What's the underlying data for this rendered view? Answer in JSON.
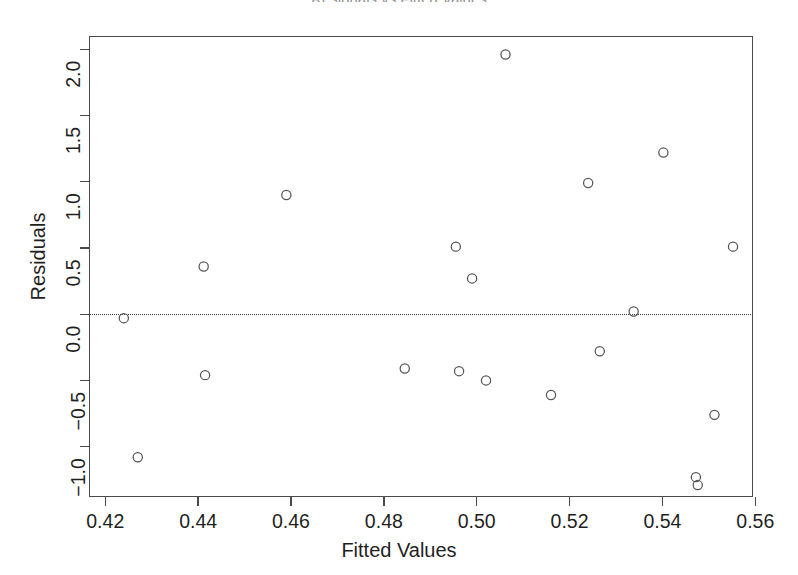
{
  "chart_data": {
    "type": "scatter",
    "title": "Residuals vs Fitted Values",
    "xlabel": "Fitted Values",
    "ylabel": "Residuals",
    "xlim": [
      0.4165,
      0.5595
    ],
    "ylim": [
      -1.38,
      2.1
    ],
    "xticks": [
      0.42,
      0.44,
      0.46,
      0.48,
      0.5,
      0.52,
      0.54,
      0.56
    ],
    "xticklabels": [
      "0.42",
      "0.44",
      "0.46",
      "0.48",
      "0.50",
      "0.52",
      "0.54",
      "0.56"
    ],
    "yticks": [
      -1.0,
      -0.5,
      0.0,
      0.5,
      1.0,
      1.5,
      2.0
    ],
    "yticklabels": [
      "-1.0",
      "-0.5",
      "0.0",
      "0.5",
      "1.0",
      "1.5",
      "2.0"
    ],
    "grid": false,
    "legend": null,
    "reference_line": {
      "orientation": "horizontal",
      "y": 0.0,
      "style": "dotted",
      "color": "#3c3c3c"
    },
    "marker": {
      "shape": "open-circle",
      "radius_px": 4.6,
      "stroke": "#555555",
      "fill": "none"
    },
    "n_points": 21,
    "x": [
      0.424,
      0.427,
      0.4412,
      0.4415,
      0.459,
      0.4845,
      0.4955,
      0.4962,
      0.499,
      0.502,
      0.5062,
      0.516,
      0.517,
      0.524,
      0.5265,
      0.5338,
      0.5402,
      0.5472,
      0.5476,
      0.5512,
      0.5552
    ],
    "y": [
      -0.03,
      -1.08,
      0.36,
      -0.46,
      0.9,
      -0.41,
      0.51,
      -0.43,
      0.27,
      -0.5,
      1.96,
      -0.61,
      -0.61,
      0.99,
      -0.28,
      0.02,
      1.22,
      -1.23,
      -1.29,
      -0.76,
      0.51
    ],
    "points": [
      {
        "x": 0.424,
        "y": -0.03
      },
      {
        "x": 0.427,
        "y": -1.08
      },
      {
        "x": 0.4412,
        "y": 0.36
      },
      {
        "x": 0.4415,
        "y": -0.46
      },
      {
        "x": 0.459,
        "y": 0.9
      },
      {
        "x": 0.4845,
        "y": -0.41
      },
      {
        "x": 0.4955,
        "y": 0.51
      },
      {
        "x": 0.4962,
        "y": -0.43
      },
      {
        "x": 0.499,
        "y": 0.27
      },
      {
        "x": 0.502,
        "y": -0.5
      },
      {
        "x": 0.5062,
        "y": 1.96
      },
      {
        "x": 0.516,
        "y": -0.61
      },
      {
        "x": 0.524,
        "y": 0.99
      },
      {
        "x": 0.5265,
        "y": -0.28
      },
      {
        "x": 0.5338,
        "y": 0.02
      },
      {
        "x": 0.5402,
        "y": 1.22
      },
      {
        "x": 0.5472,
        "y": -1.23
      },
      {
        "x": 0.5476,
        "y": -1.29
      },
      {
        "x": 0.5512,
        "y": -0.76
      },
      {
        "x": 0.5552,
        "y": 0.51
      }
    ]
  },
  "axes": {
    "frame": {
      "left": 89,
      "top": 36,
      "width": 664,
      "height": 461
    },
    "colors": {
      "frame": "#4a4a4a",
      "marker": "#555555",
      "reference_line": "#3c3c3c",
      "text": "#1f1f1f",
      "background": "#ffffff"
    }
  }
}
